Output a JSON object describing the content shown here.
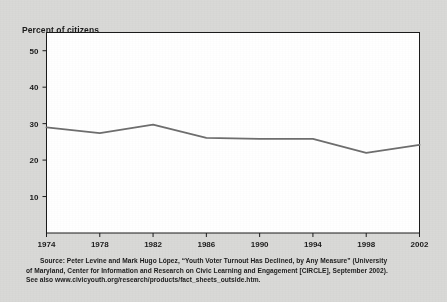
{
  "figure": {
    "background_color": "#d9d9d7",
    "plot_background_color": "#ffffff",
    "axis_color": "#1b1b1b",
    "line_color": "#6e6e6e"
  },
  "chart_data": {
    "type": "line",
    "title": "",
    "ylabel": "Percent of citizens",
    "xlabel": "",
    "categories": [
      "1974",
      "1978",
      "1982",
      "1986",
      "1990",
      "1994",
      "1998",
      "2002"
    ],
    "x": [
      1974,
      1978,
      1982,
      1986,
      1990,
      1994,
      1998,
      2002
    ],
    "values": [
      29,
      27.4,
      29.7,
      26.1,
      25.8,
      25.8,
      22,
      24.2
    ],
    "series": [
      {
        "name": "Percent of citizens",
        "values": [
          29,
          27.4,
          29.7,
          26.1,
          25.8,
          25.8,
          22,
          24.2
        ]
      }
    ],
    "ylim": [
      0,
      55
    ],
    "xlim": [
      1974,
      2002
    ],
    "ytick_labels": [
      "10",
      "20",
      "30",
      "40",
      "50"
    ],
    "yticks": [
      10,
      20,
      30,
      40,
      50
    ],
    "xtick_labels": [
      "1974",
      "1978",
      "1982",
      "1986",
      "1990",
      "1994",
      "1998",
      "2002"
    ],
    "grid": false,
    "legend": false,
    "legend_position": "none",
    "line_color": "#6e6e6e",
    "line_width": 1.8
  },
  "axis_title": "Percent of citizens",
  "source": {
    "line1": "Source:  Peter Levine and Mark Hugo López, “Youth Voter Turnout Has Declined, by Any Measure” (University",
    "line2": "of Maryland, Center for Information and Research on Civic Learning and Engagement [CIRCLE], September 2002).",
    "line3": "See also www.civicyouth.org/research/products/fact_sheets_outside.htm."
  }
}
